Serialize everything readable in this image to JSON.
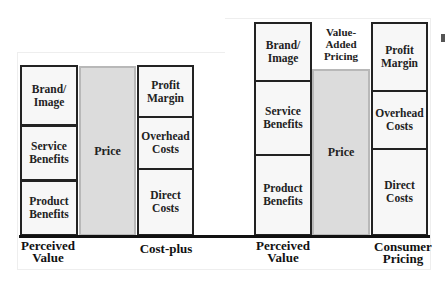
{
  "diagrams": [
    {
      "name": "perceived-vs-costplus",
      "perceived_value": {
        "boxes": [
          "Brand/ Image",
          "Service Benefits",
          "Product Benefits"
        ],
        "label": "Perceived Value"
      },
      "price": "Price",
      "cost_plus": {
        "boxes": [
          "Profit Margin",
          "Overhead Costs",
          "Direct Costs"
        ],
        "label": "Cost-plus"
      }
    },
    {
      "name": "perceived-vs-consumer-pricing",
      "perceived_value": {
        "boxes": [
          "Brand/ Image",
          "Service Benefits",
          "Product Benefits"
        ],
        "label": "Perceived Value"
      },
      "value_added_label": "Value-Added Pricing",
      "price": "Price",
      "consumer_pricing": {
        "boxes": [
          "Profit Margin",
          "Overhead Costs",
          "Direct Costs"
        ],
        "label": "Consumer Pricing"
      }
    }
  ],
  "colors": {
    "box_fill": "#f7f7f7",
    "box_border": "#222222",
    "price_fill": "#dcdcdc",
    "price_border": "#b8b8b8"
  }
}
